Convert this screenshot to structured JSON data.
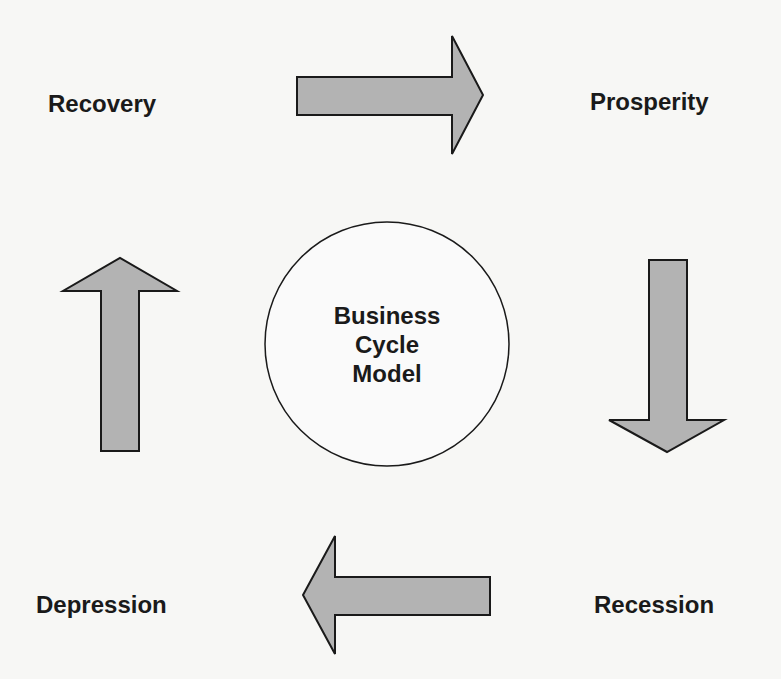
{
  "diagram": {
    "title": "Business Cycle Model",
    "center": {
      "line1": "Business",
      "line2": "Cycle",
      "line3": "Model"
    },
    "phases": {
      "recovery": "Recovery",
      "prosperity": "Prosperity",
      "recession": "Recession",
      "depression": "Depression"
    },
    "flow": [
      "Recovery",
      "Prosperity",
      "Recession",
      "Depression",
      "Recovery"
    ],
    "colors": {
      "arrow_fill": "#b3b3b3",
      "stroke": "#1a1a1a",
      "background": "#f7f7f5"
    }
  }
}
